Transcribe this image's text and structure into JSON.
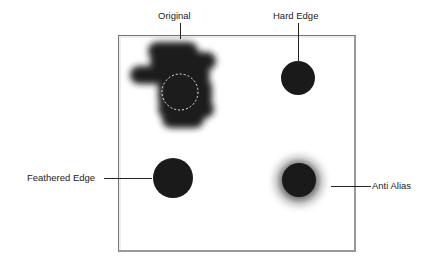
{
  "labels": {
    "original": "Original",
    "hard_edge": "Hard Edge",
    "feathered_edge": "Feathered Edge",
    "anti_alias": "Anti Alias"
  },
  "colors": {
    "blob": "#1a1a1a",
    "selection": "#e8e8e8",
    "frame": "#777777"
  }
}
